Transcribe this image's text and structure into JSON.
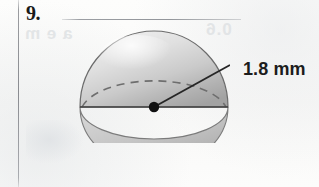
{
  "page": {
    "background_color": "#fbfbfa",
    "margin_rule_color": "#7a7c82"
  },
  "problem": {
    "number_label": "9.",
    "answer_blank_placeholder": ""
  },
  "ghost_text": {
    "left": "a e m",
    "right": "0.6"
  },
  "figure": {
    "shape_name": "hemisphere",
    "fill_light_color": "#dcdcdc",
    "fill_dark_color": "#a6a6a6",
    "outline_color": "#6f6f6f",
    "diameter_line_color": "#4a4a4a",
    "dashed_arc_color": "#707070",
    "center_dot_color": "#121212",
    "leader_line_color": "#2a2a2a",
    "labels": {
      "radius": "1.8 mm"
    }
  }
}
